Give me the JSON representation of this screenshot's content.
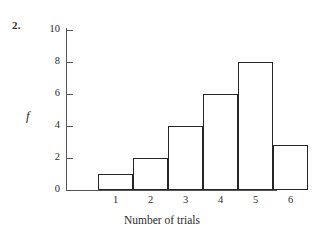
{
  "figure": {
    "problem_number": "2.",
    "background_color": "#ffffff",
    "line_color": "#262626",
    "axis_color": "#555555"
  },
  "chart_data": {
    "type": "bar",
    "title": "",
    "subtitle": "",
    "xlabel": "Number of trials",
    "ylabel": "f",
    "categories": [
      "1",
      "2",
      "3",
      "4",
      "5",
      "6"
    ],
    "values": [
      1,
      2,
      4,
      6,
      8,
      2.8
    ],
    "series": [
      {
        "name": "f",
        "values": [
          1,
          2,
          4,
          6,
          8,
          2.8
        ]
      }
    ],
    "ylim": [
      0,
      10
    ],
    "xlim": [
      0.5,
      6.5
    ],
    "y_ticks": [
      0,
      2,
      4,
      6,
      8,
      10
    ],
    "y_tick_labels": [
      "0",
      "2",
      "4",
      "6",
      "8",
      "10"
    ],
    "x_ticks": [
      1,
      2,
      3,
      4,
      5,
      6
    ],
    "x_tick_labels": [
      "1",
      "2",
      "3",
      "4",
      "5",
      "6"
    ],
    "grid": false,
    "legend": false,
    "bar_style": "outline",
    "bars_contiguous": true,
    "annotations": [
      "2."
    ]
  }
}
